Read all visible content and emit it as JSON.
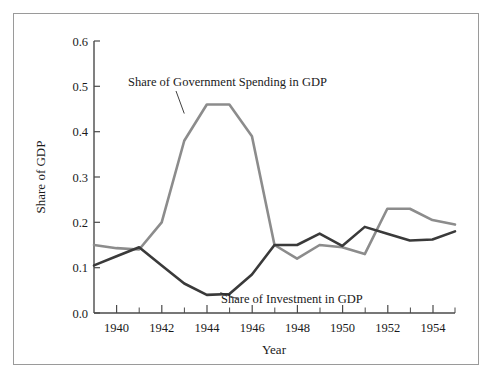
{
  "chart_data": {
    "type": "line",
    "title": "",
    "xlabel": "Year",
    "ylabel": "Share of GDP",
    "xlim": [
      1939,
      1955
    ],
    "ylim": [
      0.0,
      0.6
    ],
    "grid": false,
    "legend_position": "inline-annotations",
    "x": [
      1939,
      1940,
      1941,
      1942,
      1943,
      1944,
      1945,
      1946,
      1947,
      1948,
      1949,
      1950,
      1951,
      1952,
      1953,
      1954,
      1955
    ],
    "x_tick_labels": [
      "1940",
      "1942",
      "1944",
      "1946",
      "1948",
      "1950",
      "1952",
      "1954"
    ],
    "x_tick_values": [
      1940,
      1942,
      1944,
      1946,
      1948,
      1950,
      1952,
      1954
    ],
    "x_minor_tick_values": [
      1939,
      1941,
      1943,
      1945,
      1947,
      1949,
      1951,
      1953,
      1955
    ],
    "y_tick_labels": [
      "0.0",
      "0.1",
      "0.2",
      "0.3",
      "0.4",
      "0.5",
      "0.6"
    ],
    "y_tick_values": [
      0.0,
      0.1,
      0.2,
      0.3,
      0.4,
      0.5,
      0.6
    ],
    "series": [
      {
        "name": "Share of Government Spending in GDP",
        "color": "#8c8c8c",
        "values": [
          0.15,
          0.143,
          0.14,
          0.2,
          0.38,
          0.46,
          0.46,
          0.39,
          0.15,
          0.12,
          0.15,
          0.145,
          0.13,
          0.23,
          0.23,
          0.205,
          0.195
        ]
      },
      {
        "name": "Share of Investment in GDP",
        "color": "#3a3a3a",
        "values": [
          0.105,
          0.125,
          0.145,
          0.105,
          0.065,
          0.04,
          0.042,
          0.085,
          0.15,
          0.15,
          0.175,
          0.148,
          0.19,
          0.175,
          0.16,
          0.162,
          0.18
        ]
      }
    ],
    "annotations": [
      {
        "text": "Share of Government Spending in GDP",
        "target_x": 1943.0,
        "target_y": 0.44
      },
      {
        "text": "Share of Investment in GDP",
        "target_x": 1944.6,
        "target_y": 0.045
      }
    ]
  },
  "axes": {
    "y_title": "Share of GDP",
    "x_title": "Year"
  },
  "labels": {
    "y0": "0.0",
    "y1": "0.1",
    "y2": "0.2",
    "y3": "0.3",
    "y4": "0.4",
    "y5": "0.5",
    "y6": "0.6",
    "x1940": "1940",
    "x1942": "1942",
    "x1944": "1944",
    "x1946": "1946",
    "x1948": "1948",
    "x1950": "1950",
    "x1952": "1952",
    "x1954": "1954",
    "annot_gov": "Share of Government Spending in GDP",
    "annot_inv": "Share of Investment in GDP"
  }
}
